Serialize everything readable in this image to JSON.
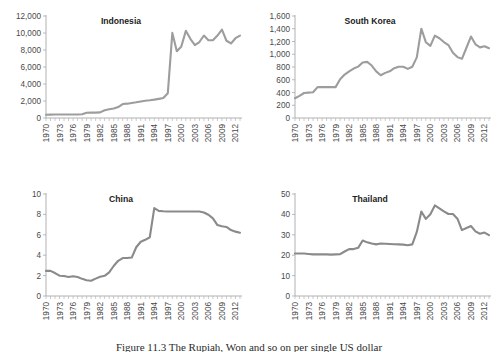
{
  "figure": {
    "caption": "Figure 11.3   The Rupiah, Won and so on per single US dollar",
    "panel_order": [
      "indonesia",
      "southkorea",
      "china",
      "thailand"
    ]
  },
  "chart_data": [
    {
      "id": "indonesia",
      "type": "line",
      "title": "Indonesia",
      "xlabel": "",
      "ylabel": "",
      "grid": false,
      "legend": "none",
      "line_color": "#9d9d9d",
      "xlim": [
        1970,
        2013
      ],
      "ylim": [
        0,
        12000
      ],
      "yticks": [
        0,
        2000,
        4000,
        6000,
        8000,
        10000,
        12000
      ],
      "ytick_labels": [
        "0",
        "2,000",
        "4,000",
        "6,000",
        "8,000",
        "10,000",
        "12,000"
      ],
      "xticks": [
        1970,
        1973,
        1976,
        1979,
        1982,
        1985,
        1988,
        1991,
        1994,
        1997,
        2000,
        2003,
        2006,
        2009,
        2012
      ],
      "xtick_labels": [
        "1970",
        "1973",
        "1976",
        "1979",
        "1982",
        "1985",
        "1988",
        "1991",
        "1994",
        "1997",
        "2000",
        "2003",
        "2006",
        "2009",
        "2012"
      ],
      "x": [
        1970,
        1971,
        1972,
        1973,
        1974,
        1975,
        1976,
        1977,
        1978,
        1979,
        1980,
        1981,
        1982,
        1983,
        1984,
        1985,
        1986,
        1987,
        1988,
        1989,
        1990,
        1991,
        1992,
        1993,
        1994,
        1995,
        1996,
        1997,
        1998,
        1999,
        2000,
        2001,
        2002,
        2003,
        2004,
        2005,
        2006,
        2007,
        2008,
        2009,
        2010,
        2011,
        2012,
        2013
      ],
      "values": [
        378,
        392,
        415,
        415,
        415,
        415,
        415,
        415,
        442,
        623,
        627,
        632,
        661,
        909,
        1026,
        1111,
        1283,
        1644,
        1686,
        1770,
        1843,
        1950,
        2030,
        2087,
        2161,
        2249,
        2342,
        2909,
        10014,
        7855,
        8422,
        10261,
        9311,
        8577,
        8939,
        9705,
        9159,
        9141,
        9699,
        10390,
        9090,
        8770,
        9387,
        9693
      ]
    },
    {
      "id": "southkorea",
      "type": "line",
      "title": "South Korea",
      "xlabel": "",
      "ylabel": "",
      "grid": false,
      "legend": "none",
      "line_color": "#9d9d9d",
      "xlim": [
        1970,
        2013
      ],
      "ylim": [
        0,
        1600
      ],
      "yticks": [
        0,
        200,
        400,
        600,
        800,
        1000,
        1200,
        1400,
        1600
      ],
      "ytick_labels": [
        "0",
        "200",
        "400",
        "600",
        "800",
        "1,000",
        "1,200",
        "1,400",
        "1,600"
      ],
      "xticks": [
        1970,
        1973,
        1976,
        1979,
        1982,
        1985,
        1988,
        1991,
        1994,
        1997,
        2000,
        2003,
        2006,
        2009,
        2012
      ],
      "xtick_labels": [
        "1970",
        "1973",
        "1976",
        "1979",
        "1982",
        "1985",
        "1988",
        "1991",
        "1994",
        "1997",
        "2000",
        "2003",
        "2006",
        "2009",
        "2012"
      ],
      "x": [
        1970,
        1971,
        1972,
        1973,
        1974,
        1975,
        1976,
        1977,
        1978,
        1979,
        1980,
        1981,
        1982,
        1983,
        1984,
        1985,
        1986,
        1987,
        1988,
        1989,
        1990,
        1991,
        1992,
        1993,
        1994,
        1995,
        1996,
        1997,
        1998,
        1999,
        2000,
        2001,
        2002,
        2003,
        2004,
        2005,
        2006,
        2007,
        2008,
        2009,
        2010,
        2011,
        2012,
        2013
      ],
      "values": [
        310,
        347,
        392,
        398,
        404,
        484,
        484,
        484,
        484,
        484,
        607,
        681,
        731,
        776,
        806,
        870,
        881,
        823,
        731,
        671,
        708,
        733,
        781,
        803,
        803,
        771,
        804,
        951,
        1401,
        1189,
        1131,
        1291,
        1251,
        1192,
        1145,
        1024,
        955,
        929,
        1102,
        1277,
        1156,
        1108,
        1126,
        1095
      ]
    },
    {
      "id": "china",
      "type": "line",
      "title": "China",
      "xlabel": "",
      "ylabel": "",
      "grid": false,
      "legend": "none",
      "line_color": "#8a8a8a",
      "xlim": [
        1970,
        2013
      ],
      "ylim": [
        0,
        10
      ],
      "yticks": [
        0,
        2,
        4,
        6,
        8,
        10
      ],
      "ytick_labels": [
        "0",
        "2",
        "4",
        "6",
        "8",
        "10"
      ],
      "xticks": [
        1970,
        1973,
        1976,
        1979,
        1982,
        1985,
        1988,
        1991,
        1994,
        1997,
        2000,
        2003,
        2006,
        2009,
        2012
      ],
      "xtick_labels": [
        "1970",
        "1973",
        "1976",
        "1979",
        "1982",
        "1985",
        "1988",
        "1991",
        "1994",
        "1997",
        "2000",
        "2003",
        "2006",
        "2009",
        "2012"
      ],
      "x": [
        1970,
        1971,
        1972,
        1973,
        1974,
        1975,
        1976,
        1977,
        1978,
        1979,
        1980,
        1981,
        1982,
        1983,
        1984,
        1985,
        1986,
        1987,
        1988,
        1989,
        1990,
        1991,
        1992,
        1993,
        1994,
        1995,
        1996,
        1997,
        1998,
        1999,
        2000,
        2001,
        2002,
        2003,
        2004,
        2005,
        2006,
        2007,
        2008,
        2009,
        2010,
        2011,
        2012,
        2013
      ],
      "values": [
        2.46,
        2.46,
        2.25,
        1.99,
        1.96,
        1.86,
        1.94,
        1.86,
        1.68,
        1.55,
        1.5,
        1.7,
        1.89,
        1.98,
        2.32,
        2.94,
        3.45,
        3.72,
        3.72,
        3.77,
        4.78,
        5.32,
        5.51,
        5.76,
        8.62,
        8.35,
        8.31,
        8.29,
        8.28,
        8.28,
        8.28,
        8.28,
        8.28,
        8.28,
        8.28,
        8.19,
        7.97,
        7.61,
        6.95,
        6.83,
        6.77,
        6.46,
        6.31,
        6.2
      ]
    },
    {
      "id": "thailand",
      "type": "line",
      "title": "Thailand",
      "xlabel": "",
      "ylabel": "",
      "grid": false,
      "legend": "none",
      "line_color": "#8a8a8a",
      "xlim": [
        1970,
        2013
      ],
      "ylim": [
        0,
        50
      ],
      "yticks": [
        0,
        10,
        20,
        30,
        40,
        50
      ],
      "ytick_labels": [
        "0",
        "10",
        "20",
        "30",
        "40",
        "50"
      ],
      "xticks": [
        1970,
        1973,
        1976,
        1979,
        1982,
        1985,
        1988,
        1991,
        1994,
        1997,
        2000,
        2003,
        2006,
        2009,
        2012
      ],
      "xtick_labels": [
        "1970",
        "1973",
        "1976",
        "1979",
        "1982",
        "1985",
        "1988",
        "1991",
        "1994",
        "1997",
        "2000",
        "2003",
        "2006",
        "2009",
        "2012"
      ],
      "x": [
        1970,
        1971,
        1972,
        1973,
        1974,
        1975,
        1976,
        1977,
        1978,
        1979,
        1980,
        1981,
        1982,
        1983,
        1984,
        1985,
        1986,
        1987,
        1988,
        1989,
        1990,
        1991,
        1992,
        1993,
        1994,
        1995,
        1996,
        1997,
        1998,
        1999,
        2000,
        2001,
        2002,
        2003,
        2004,
        2005,
        2006,
        2007,
        2008,
        2009,
        2010,
        2011,
        2012,
        2013
      ],
      "values": [
        20.8,
        20.8,
        20.8,
        20.6,
        20.4,
        20.4,
        20.4,
        20.4,
        20.3,
        20.4,
        20.5,
        21.8,
        23.0,
        23.0,
        23.6,
        27.2,
        26.3,
        25.7,
        25.3,
        25.7,
        25.6,
        25.5,
        25.4,
        25.3,
        25.2,
        24.9,
        25.3,
        31.4,
        41.4,
        37.8,
        40.1,
        44.4,
        43.0,
        41.5,
        40.2,
        40.2,
        37.9,
        32.3,
        33.3,
        34.3,
        31.7,
        30.5,
        31.1,
        29.8
      ]
    }
  ]
}
